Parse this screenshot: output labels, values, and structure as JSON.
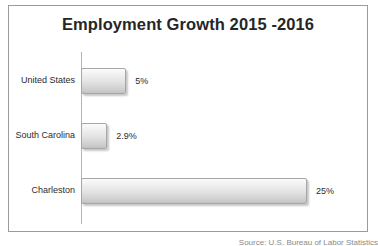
{
  "chart_data": {
    "type": "bar",
    "orientation": "horizontal",
    "title": "Employment Growth 2015 -2016",
    "xlabel": "",
    "ylabel": "",
    "categories": [
      "United States",
      "South Carolina",
      "Charleston"
    ],
    "values": [
      5,
      2.9,
      25
    ],
    "value_labels": [
      "5%",
      "2.9%",
      "25%"
    ],
    "xlim": [
      0,
      25
    ],
    "grid": false,
    "legend": false,
    "bar_color": "#e2e2e2",
    "bar_border_color": "#a6a6a6",
    "title_color": "#262626",
    "axis_line_color": "#b5b5b5",
    "frame_border_color": "#9b9b9b"
  },
  "footer": {
    "source_note": "Source: U.S. Bureau of Labor Statistics"
  }
}
